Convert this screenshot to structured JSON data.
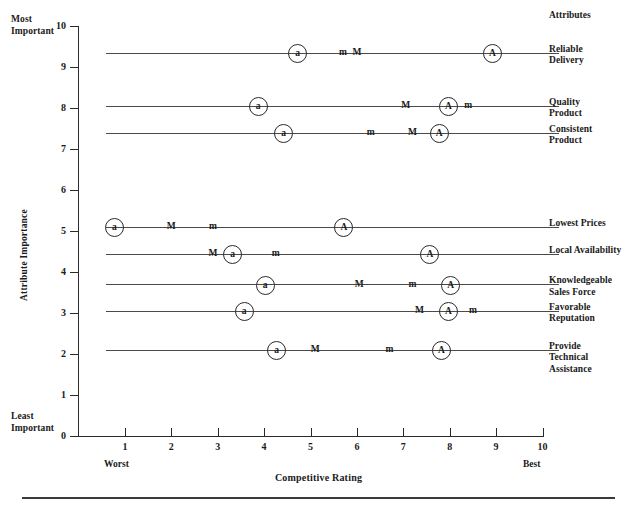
{
  "labels": {
    "most_important": "Most\nImportant",
    "least_important": "Least\nImportant",
    "y_axis_title": "Attribute Importance",
    "x_axis_title": "Competitive Rating",
    "worst": "Worst",
    "best": "Best",
    "attributes_header": "Attributes"
  },
  "chart_data": {
    "type": "scatter",
    "title": "",
    "xlabel": "Competitive Rating",
    "ylabel": "Attribute Importance",
    "xlim": [
      0,
      10
    ],
    "ylim": [
      0,
      10
    ],
    "xticks": [
      0,
      1,
      2,
      3,
      4,
      5,
      6,
      7,
      8,
      9,
      10
    ],
    "yticks": [
      0,
      1,
      2,
      3,
      4,
      5,
      6,
      7,
      8,
      9,
      10
    ],
    "grid": false,
    "legend": "none",
    "x_axis_endpoints": [
      "Worst",
      "Best"
    ],
    "y_axis_endpoints": [
      "Least Important",
      "Most Important"
    ],
    "marker_key": [
      "a",
      "m",
      "M",
      "A"
    ],
    "series_note": "Circled markers denote the company; plain letters denote competitors.",
    "rows": [
      {
        "attribute": "Reliable Delivery",
        "importance": 9.35,
        "points": [
          {
            "label": "a",
            "rating": 4.7,
            "circled": true
          },
          {
            "label": "m",
            "rating": 5.7,
            "circled": false
          },
          {
            "label": "M",
            "rating": 6.0,
            "circled": false
          },
          {
            "label": "A",
            "rating": 8.9,
            "circled": true
          }
        ]
      },
      {
        "attribute": "Quality Product",
        "importance": 8.05,
        "points": [
          {
            "label": "a",
            "rating": 3.85,
            "circled": true
          },
          {
            "label": "M",
            "rating": 7.05,
            "circled": false
          },
          {
            "label": "A",
            "rating": 7.95,
            "circled": true
          },
          {
            "label": "m",
            "rating": 8.4,
            "circled": false
          }
        ]
      },
      {
        "attribute": "Consistent Product",
        "importance": 7.4,
        "points": [
          {
            "label": "a",
            "rating": 4.4,
            "circled": true
          },
          {
            "label": "m",
            "rating": 6.3,
            "circled": false
          },
          {
            "label": "M",
            "rating": 7.2,
            "circled": false
          },
          {
            "label": "A",
            "rating": 7.75,
            "circled": true
          }
        ]
      },
      {
        "attribute": "Lowest Prices",
        "importance": 5.1,
        "points": [
          {
            "label": "a",
            "rating": 0.75,
            "circled": true
          },
          {
            "label": "M",
            "rating": 2.0,
            "circled": false
          },
          {
            "label": "m",
            "rating": 2.9,
            "circled": false
          },
          {
            "label": "A",
            "rating": 5.7,
            "circled": true
          }
        ]
      },
      {
        "attribute": "Local Availability",
        "importance": 4.45,
        "points": [
          {
            "label": "M",
            "rating": 2.9,
            "circled": false
          },
          {
            "label": "a",
            "rating": 3.3,
            "circled": true
          },
          {
            "label": "m",
            "rating": 4.25,
            "circled": false
          },
          {
            "label": "A",
            "rating": 7.55,
            "circled": true
          }
        ]
      },
      {
        "attribute": "Knowledgeable Sales Force",
        "importance": 3.7,
        "points": [
          {
            "label": "a",
            "rating": 4.0,
            "circled": true
          },
          {
            "label": "M",
            "rating": 6.05,
            "circled": false
          },
          {
            "label": "m",
            "rating": 7.2,
            "circled": false
          },
          {
            "label": "A",
            "rating": 8.0,
            "circled": true
          }
        ]
      },
      {
        "attribute": "Favorable Reputation",
        "importance": 3.05,
        "points": [
          {
            "label": "a",
            "rating": 3.55,
            "circled": true
          },
          {
            "label": "M",
            "rating": 7.35,
            "circled": false
          },
          {
            "label": "A",
            "rating": 7.95,
            "circled": true
          },
          {
            "label": "m",
            "rating": 8.5,
            "circled": false
          }
        ]
      },
      {
        "attribute": "Provide Technical Assistance",
        "importance": 2.1,
        "points": [
          {
            "label": "a",
            "rating": 4.25,
            "circled": true
          },
          {
            "label": "M",
            "rating": 5.1,
            "circled": false
          },
          {
            "label": "m",
            "rating": 6.7,
            "circled": false
          },
          {
            "label": "A",
            "rating": 7.8,
            "circled": true
          }
        ]
      }
    ],
    "row_label_lines": [
      [
        "Reliable",
        "Delivery"
      ],
      [
        "Quality",
        "Product"
      ],
      [
        "Consistent",
        "Product"
      ],
      [
        "Lowest Prices"
      ],
      [
        "Local Availability"
      ],
      [
        "Knowledgeable",
        "Sales Force"
      ],
      [
        "Favorable",
        "Reputation"
      ],
      [
        "Provide",
        "Technical",
        "Assistance"
      ]
    ]
  },
  "colors": {
    "axis": "#2a2a2a",
    "row_line": "#4a4a4a",
    "text": "#1a1a1a",
    "rule": "#3a3a3a"
  }
}
